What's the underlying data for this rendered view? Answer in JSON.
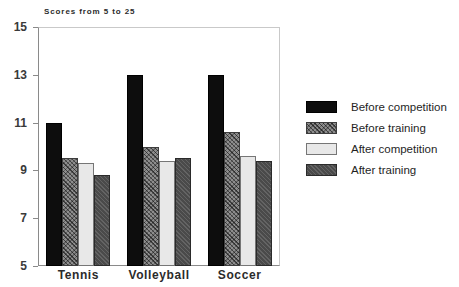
{
  "chart_data": {
    "type": "bar",
    "title": "Scores from 5 to 25",
    "xlabel": "",
    "ylabel": "",
    "categories": [
      "Tennis",
      "Volleyball",
      "Soccer"
    ],
    "ylim": [
      5,
      15
    ],
    "yticks": [
      15,
      13,
      11,
      9,
      7,
      5
    ],
    "grid": false,
    "legend_position": "right",
    "series": [
      {
        "name": "Before competition",
        "swatch": "solid-black",
        "color": "#0d0d0d",
        "values": [
          11.0,
          13.0,
          13.0
        ]
      },
      {
        "name": "Before training",
        "swatch": "crosshatch-gray",
        "color": "#8d8d8d",
        "values": [
          9.5,
          10.0,
          10.6
        ]
      },
      {
        "name": "After competition",
        "swatch": "light-gray",
        "color": "#e8e8e8",
        "values": [
          9.3,
          9.4,
          9.6
        ]
      },
      {
        "name": "After training",
        "swatch": "dark-gray",
        "color": "#4a4a4a",
        "values": [
          8.8,
          9.5,
          9.4
        ]
      }
    ]
  }
}
